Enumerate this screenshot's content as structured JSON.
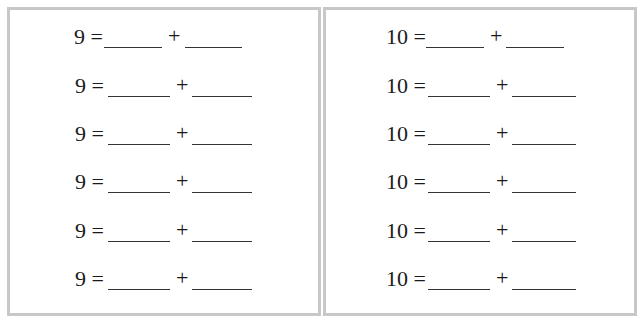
{
  "left_panel": {
    "rows": [
      {
        "total": "9",
        "equals": "=",
        "plus": "+"
      },
      {
        "total": "9",
        "equals": "=",
        "plus": "+"
      },
      {
        "total": "9",
        "equals": "=",
        "plus": "+"
      },
      {
        "total": "9",
        "equals": "=",
        "plus": "+"
      },
      {
        "total": "9",
        "equals": "=",
        "plus": "+"
      },
      {
        "total": "9",
        "equals": "=",
        "plus": "+"
      }
    ]
  },
  "right_panel": {
    "rows": [
      {
        "total": "10",
        "equals": "=",
        "plus": "+"
      },
      {
        "total": "10",
        "equals": "=",
        "plus": "+"
      },
      {
        "total": "10",
        "equals": "=",
        "plus": "+"
      },
      {
        "total": "10",
        "equals": "=",
        "plus": "+"
      },
      {
        "total": "10",
        "equals": "=",
        "plus": "+"
      },
      {
        "total": "10",
        "equals": "=",
        "plus": "+"
      }
    ]
  }
}
